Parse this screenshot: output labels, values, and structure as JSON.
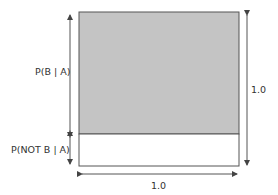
{
  "diagram": {
    "type": "probability-area-diagram",
    "labels": {
      "upper_region": "P(B | A)",
      "lower_region": "P(NOT B | A)",
      "height": "1.0",
      "width": "1.0"
    },
    "regions": [
      {
        "name": "P(B | A)",
        "fraction_of_height": 0.79,
        "fill": "#c4c4c4"
      },
      {
        "name": "P(NOT B | A)",
        "fraction_of_height": 0.21,
        "fill": "#ffffff"
      }
    ],
    "colors": {
      "stroke": "#555555",
      "shaded": "#c4c4c4",
      "text": "#333333"
    }
  }
}
